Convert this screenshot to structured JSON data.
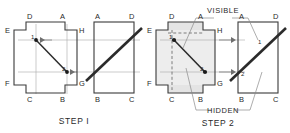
{
  "figure": {
    "type": "technical-drawing",
    "title_visible": false,
    "colors": {
      "outline": "#3a3a3a",
      "thin_line": "#9a9a9a",
      "diagonal_heavy": "#2b2b2b",
      "shade_fill": "#e2e2e2",
      "dashed": "#777777",
      "text": "#2a2a2a",
      "background": "#ffffff"
    }
  },
  "steps": [
    {
      "id": "step-1",
      "caption": "STEP I",
      "front_view": {
        "name": "cross-shape-front-view",
        "vertex_labels": [
          {
            "key": "D",
            "text": "D"
          },
          {
            "key": "A",
            "text": "A"
          },
          {
            "key": "E",
            "text": "E"
          },
          {
            "key": "H",
            "text": "H"
          },
          {
            "key": "F",
            "text": "F"
          },
          {
            "key": "G",
            "text": "G"
          },
          {
            "key": "C",
            "text": "C"
          },
          {
            "key": "B",
            "text": "B"
          }
        ],
        "points": [
          {
            "key": "1",
            "text": "1"
          },
          {
            "key": "2",
            "text": "2"
          }
        ],
        "diagonal": "line from point 1 (upper-left) to point 2 (lower-right)"
      },
      "side_view": {
        "name": "rectangle-side-view",
        "vertex_labels": [
          {
            "key": "A",
            "text": "A"
          },
          {
            "key": "D",
            "text": "D"
          },
          {
            "key": "B",
            "text": "B"
          },
          {
            "key": "C",
            "text": "C"
          }
        ],
        "diagonal": "heavy diagonal from lower-left to upper-right"
      },
      "projector_arrows": 2,
      "arrow_direction": "left"
    },
    {
      "id": "step-2",
      "caption": "STEP 2",
      "annotations": [
        {
          "key": "visible",
          "text": "VISIBLE",
          "position": "top"
        },
        {
          "key": "hidden",
          "text": "HIDDEN",
          "position": "bottom"
        }
      ],
      "front_view": {
        "name": "cross-shape-front-view",
        "vertex_labels": [
          {
            "key": "D",
            "text": "D"
          },
          {
            "key": "A",
            "text": "A"
          },
          {
            "key": "E",
            "text": "E"
          },
          {
            "key": "H",
            "text": "H"
          },
          {
            "key": "F",
            "text": "F"
          },
          {
            "key": "G",
            "text": "G"
          },
          {
            "key": "C",
            "text": "C"
          },
          {
            "key": "B",
            "text": "B"
          }
        ],
        "points": [
          {
            "key": "1",
            "text": "1"
          },
          {
            "key": "2",
            "text": "2"
          }
        ],
        "shaded_overlay": true,
        "dashed_edges": true
      },
      "side_view": {
        "name": "rectangle-side-view",
        "vertex_labels": [
          {
            "key": "A",
            "text": "A"
          },
          {
            "key": "D",
            "text": "D"
          },
          {
            "key": "B",
            "text": "B"
          },
          {
            "key": "C",
            "text": "C"
          }
        ],
        "points": [
          {
            "key": "1",
            "text": "1"
          },
          {
            "key": "2",
            "text": "2"
          }
        ],
        "diagonal": "heavy diagonal from lower-left to upper-right"
      },
      "projector_arrows": 2,
      "arrow_direction": "right"
    }
  ]
}
